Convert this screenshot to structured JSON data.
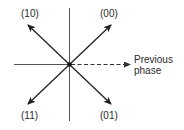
{
  "diagram": {
    "reference": {
      "label_line1": "Previous",
      "label_line2": "phase",
      "style": "dashed"
    },
    "phasors": [
      {
        "symbol": "(00)",
        "quadrant": "upper-right",
        "angle_deg": 45
      },
      {
        "symbol": "(10)",
        "quadrant": "upper-left",
        "angle_deg": 135
      },
      {
        "symbol": "(11)",
        "quadrant": "lower-left",
        "angle_deg": 225
      },
      {
        "symbol": "(01)",
        "quadrant": "lower-right",
        "angle_deg": 315
      }
    ],
    "colors": {
      "lines": "#2a2a2a",
      "axes": "#555555",
      "background": "#ffffff"
    }
  }
}
